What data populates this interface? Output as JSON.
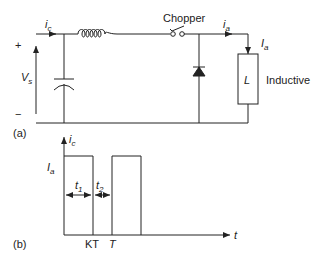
{
  "circuit": {
    "part_label": "(a)",
    "source": {
      "plus": "+",
      "minus": "−",
      "voltage_symbol": "V",
      "voltage_sub": "s"
    },
    "input_current": {
      "symbol": "i",
      "sub": "c"
    },
    "switch_label": "Chopper",
    "output_current": {
      "symbol": "i",
      "sub": "a"
    },
    "load_current": {
      "symbol": "I",
      "sub": "a"
    },
    "load": {
      "symbol": "L",
      "type_label": "Inductive"
    },
    "components": [
      "inductor",
      "capacitor",
      "chopper-switch",
      "freewheeling-diode",
      "inductive-load"
    ]
  },
  "waveform": {
    "part_label": "(b)",
    "y_axis": {
      "symbol": "i",
      "sub": "c"
    },
    "x_axis": {
      "symbol": "t"
    },
    "level": {
      "symbol": "I",
      "sub": "a"
    },
    "intervals": [
      {
        "symbol": "t",
        "sub": "1"
      },
      {
        "symbol": "t",
        "sub": "2"
      }
    ],
    "ticks": [
      "KT",
      "T"
    ]
  },
  "colors": {
    "line": "#222222",
    "background": "#ffffff"
  }
}
